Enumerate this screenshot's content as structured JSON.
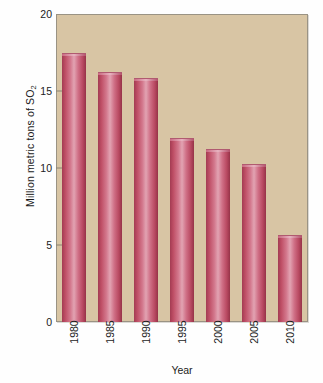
{
  "chart_data": {
    "type": "bar",
    "title": "",
    "subtitle": "",
    "xlabel": "Year",
    "ylabel": "Million metric tons of SO2",
    "ylabel_main": "Million metric tons of SO",
    "ylabel_sub": "2",
    "categories": [
      "1980",
      "1985",
      "1990",
      "1995",
      "2000",
      "2005",
      "2010"
    ],
    "values": [
      17.4,
      16.2,
      15.8,
      11.9,
      11.2,
      10.2,
      5.6
    ],
    "series": [
      {
        "name": "SO2 emissions",
        "values": [
          17.4,
          16.2,
          15.8,
          11.9,
          11.2,
          10.2,
          5.6
        ]
      }
    ],
    "ylim": [
      0,
      20
    ],
    "yticks": [
      0,
      5,
      10,
      15,
      20
    ],
    "ytick_labels": [
      "0",
      "5",
      "10",
      "15",
      "20"
    ],
    "grid": false,
    "legend": false,
    "legend_position": "none",
    "bar_color": "#c35570",
    "plot_background": "#d8c5a4",
    "frame_color": "#9a9384",
    "text_color": "#1b1b1b"
  }
}
